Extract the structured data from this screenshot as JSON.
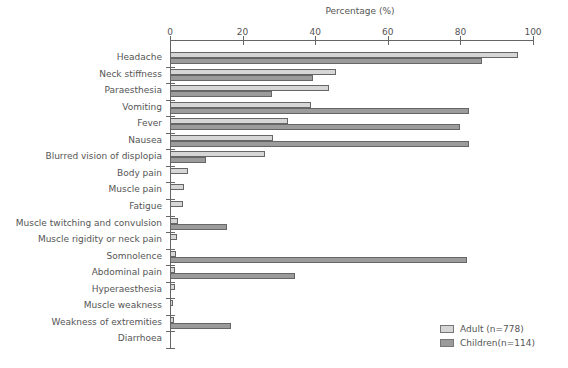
{
  "chart_data": {
    "type": "bar",
    "orientation": "horizontal",
    "title": "",
    "xlabel": "Percentage (%)",
    "ylabel": "",
    "xlim": [
      0,
      100
    ],
    "xticks": [
      0,
      20,
      40,
      60,
      80,
      100
    ],
    "grid": false,
    "legend_position": "lower right",
    "categories": [
      "Headache",
      "Neck stiffness",
      "Paraesthesia",
      "Vomiting",
      "Fever",
      "Nausea",
      "Blurred vision of displopia",
      "Body pain",
      "Muscle pain",
      "Fatigue",
      "Muscle twitching and convulsion",
      "Muscle rigidity or neck pain",
      "Somnolence",
      "Abdominal pain",
      "Hyperaesthesia",
      "Muscle weakness",
      "Weakness of extremities",
      "Diarrhoea"
    ],
    "series": [
      {
        "name": "Adult (n=778)",
        "color": "#d6d6d6",
        "values": [
          95.9,
          45.8,
          43.7,
          38.9,
          32.6,
          28.3,
          26.3,
          5.0,
          3.9,
          3.7,
          2.3,
          2.0,
          1.7,
          1.4,
          1.4,
          0.8,
          1.0,
          0
        ]
      },
      {
        "name": "Children(n=114)",
        "color": "#9b9b9b",
        "values": [
          86.0,
          39.5,
          28.0,
          82.3,
          79.9,
          82.3,
          9.8,
          0,
          0,
          0,
          15.6,
          0,
          81.7,
          34.4,
          0,
          0,
          16.8,
          0
        ]
      }
    ]
  }
}
